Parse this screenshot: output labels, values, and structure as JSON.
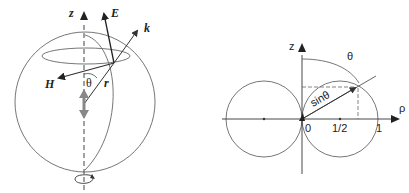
{
  "left_figure": {
    "description": "Radiating dipole inside a sphere with field vectors",
    "labels": {
      "z_axis": "z",
      "e_field": "E",
      "wave_vector": "k",
      "h_field": "H",
      "angle": "θ",
      "radius": "r"
    },
    "icons": [
      "dipole-arrow-up",
      "dipole-arrow-down",
      "rotation-symmetry-icon"
    ]
  },
  "right_figure": {
    "description": "Polar radiation pattern sinθ of dipole",
    "labels": {
      "z_axis": "z",
      "rho_axis": "ρ",
      "angle": "θ",
      "radius_label": "sinθ",
      "tick_0": "0",
      "tick_half": "1/2",
      "tick_1": "1"
    }
  },
  "colors": {
    "line": "#555555",
    "arrow": "#222222",
    "dipole": "#777777"
  }
}
